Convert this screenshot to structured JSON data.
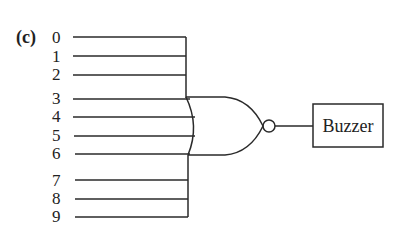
{
  "figure": {
    "part_label": "(c)",
    "inputs": [
      "0",
      "1",
      "2",
      "3",
      "4",
      "5",
      "6",
      "7",
      "8",
      "9"
    ],
    "gate": {
      "type": "NOR",
      "inputs_direct": [
        "3",
        "4",
        "5",
        "6"
      ],
      "inputs_via_bus": [
        [
          "0",
          "1",
          "2"
        ],
        [
          "7",
          "8",
          "9"
        ]
      ]
    },
    "output_device": "Buzzer"
  }
}
